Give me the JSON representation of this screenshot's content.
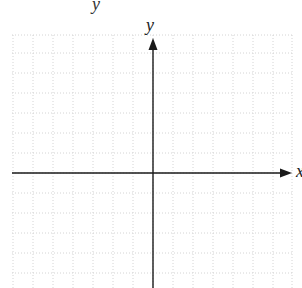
{
  "diagram": {
    "type": "coordinate-plane",
    "top_fragment": "y",
    "y_axis_label": "y",
    "x_axis_label": "x",
    "grid": {
      "left": 12,
      "right": 292,
      "top": 35,
      "bottom": 288,
      "spacing": 20,
      "line_color": "#d4d4d4",
      "dash": "1,2"
    },
    "axes": {
      "origin_x": 153,
      "origin_y": 173,
      "color": "#1a1a1a",
      "x_start": 12,
      "x_end": 292,
      "y_start": 38,
      "y_end": 288
    }
  }
}
